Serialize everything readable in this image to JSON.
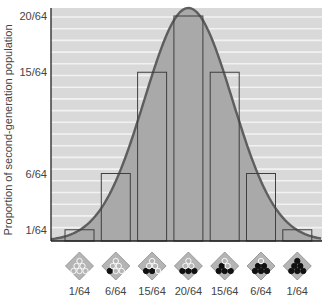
{
  "chart_data": {
    "type": "bar",
    "title": "",
    "xlabel": "",
    "ylabel": "Proportion of second-generation population",
    "ylim": [
      0,
      0.3125
    ],
    "y_ticks": [
      "1/64",
      "6/64",
      "15/64",
      "20/64"
    ],
    "y_tick_values": [
      1,
      6,
      15,
      20
    ],
    "categories": [
      "1/64",
      "6/64",
      "15/64",
      "20/64",
      "15/64",
      "6/64",
      "1/64"
    ],
    "values": [
      1,
      6,
      15,
      20,
      15,
      6,
      1
    ],
    "value_denominator": 64,
    "category_icons": [
      {
        "dark": 0,
        "light": 6
      },
      {
        "dark": 1,
        "light": 5
      },
      {
        "dark": 2,
        "light": 4
      },
      {
        "dark": 3,
        "light": 3
      },
      {
        "dark": 4,
        "light": 2
      },
      {
        "dark": 5,
        "light": 1
      },
      {
        "dark": 6,
        "light": 0
      }
    ],
    "overlay": "normal-distribution-curve",
    "grid": "horizontal-white-stripes",
    "legend": "none"
  },
  "colors": {
    "background_stripes": "#d9d9d9",
    "stripe_line": "#f2f2f2",
    "curve_fill": "#a9a9a9",
    "curve_stroke": "#5e5e5e",
    "bar_stroke": "#3f3f3f",
    "axis": "#222222",
    "icon_fill": "#b5b5b5",
    "icon_dark_dot": "#111111",
    "icon_light_dot": "#ffffff"
  }
}
